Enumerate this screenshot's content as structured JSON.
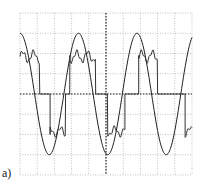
{
  "figure": {
    "label": "a)"
  },
  "chart_data": {
    "type": "line",
    "title": "",
    "xlabel": "",
    "ylabel": "",
    "grid": true,
    "grid_divisions": {
      "x": 10,
      "y": 8
    },
    "xlim": [
      0,
      10
    ],
    "ylim": [
      -4,
      4
    ],
    "series": [
      {
        "name": "sinusoid",
        "description": "sinusoidal waveform, ~3.4 div period, amplitude ~3 div",
        "x": [
          0,
          0.85,
          1.7,
          2.55,
          3.4,
          4.25,
          5.1,
          5.95,
          6.8,
          7.65,
          8.5,
          9.35,
          10
        ],
        "values": [
          3.0,
          0.1,
          -3.0,
          -0.1,
          3.0,
          0.1,
          -3.0,
          -0.1,
          3.0,
          0.1,
          -3.0,
          -0.2,
          -2.9
        ]
      },
      {
        "name": "stepped waveform",
        "description": "multilevel stepped waveform with ripple on top levels",
        "x": [
          0,
          0.6,
          1.2,
          1.9,
          2.0,
          2.7,
          3.0,
          4.0,
          5.0,
          6.0,
          6.9,
          7.5,
          8.0,
          9.0,
          10
        ],
        "values": [
          1.7,
          2.0,
          2.0,
          0.0,
          0.0,
          -2.0,
          -1.8,
          0.0,
          1.8,
          0.0,
          -2.0,
          -1.8,
          0.0,
          2.0,
          -2.0
        ]
      }
    ]
  }
}
